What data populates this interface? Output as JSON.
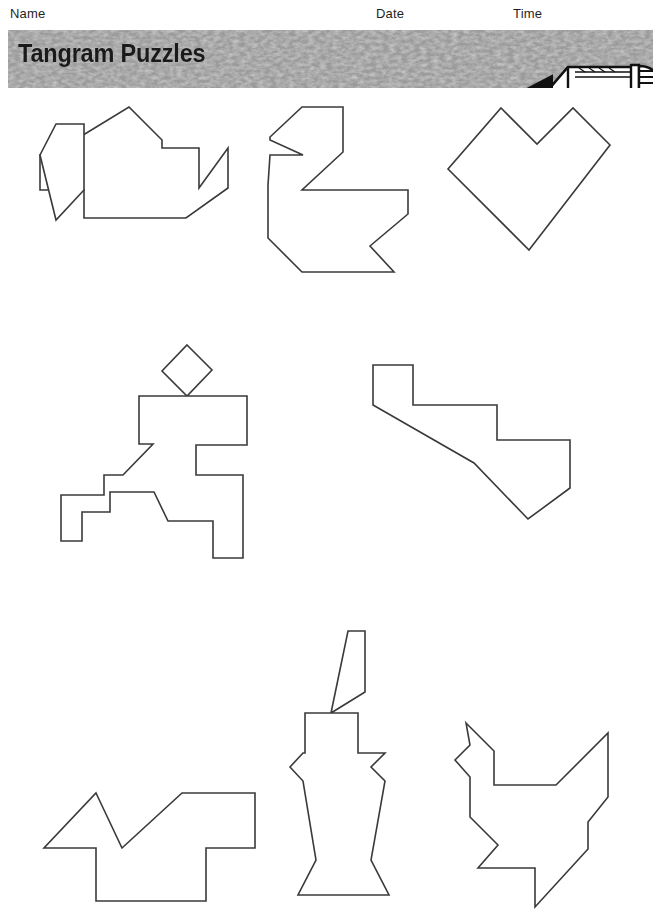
{
  "header": {
    "name_label": "Name",
    "date_label": "Date",
    "time_label": "Time"
  },
  "banner": {
    "title": "Tangram Puzzles",
    "background_color": "#a8a8a8",
    "text_color": "#1a1a1a",
    "pencil_icon": "pencil-icon"
  },
  "page": {
    "background_color": "#ffffff",
    "outline_color": "#3a3a3a",
    "fill_color": "#ffffff"
  },
  "puzzles": [
    {
      "name": "teapot",
      "row": 1,
      "column": 1,
      "parts": [
        {
          "name": "teapot-body",
          "points": "75,140 129,107 162,140 162,148 199,148 199,188 228,148 228,188 186,218 84,218 84,190 75,190"
        },
        {
          "name": "teapot-handle",
          "points": "40,155 40,190 75,190 75,155"
        },
        {
          "name": "teapot-spout",
          "points": "40,155 56,124 84,124 84,190 56,220"
        }
      ]
    },
    {
      "name": "swan",
      "row": 1,
      "column": 2,
      "parts": [
        {
          "name": "swan-outline",
          "points": "302,107 343,107 343,152 302,190 348,190 408,190 408,214 370,246 394,272 302,272 268,238 268,185 270,155 303,155 270,140 270,137"
        }
      ]
    },
    {
      "name": "heart",
      "row": 1,
      "column": 3,
      "parts": [
        {
          "name": "heart-outline",
          "points": "501,108 537,144 573,108 610,145 529,250 448,169"
        }
      ]
    },
    {
      "name": "running-person",
      "row": 2,
      "column": 1,
      "parts": [
        {
          "name": "person-head",
          "points": "187,345 212,370 187,396 162,371"
        },
        {
          "name": "person-body",
          "points": "139,396 247,396 247,445 196,445 196,475 243,475 243,558 213,558 213,521 168,521 154,492 110,492 110,512 82,512 82,541 61,541 61,495 104,495 104,475 123,475 153,444 139,444"
        }
      ]
    },
    {
      "name": "boot",
      "row": 2,
      "column": 2,
      "parts": [
        {
          "name": "boot-outline",
          "points": "373,365 413,365 413,405 497,405 497,440 570,440 570,488 528,519 474,463 373,405"
        }
      ]
    },
    {
      "name": "bird",
      "row": 3,
      "column": 1,
      "parts": [
        {
          "name": "bird-outline",
          "points": "96,793 122,848 182,793 213,793 255,793 255,848 206,848 206,901 96,901 96,848 44,848"
        }
      ]
    },
    {
      "name": "candle",
      "row": 3,
      "column": 2,
      "parts": [
        {
          "name": "candle-flame",
          "points": "331,713 348,631 365,631 365,692"
        },
        {
          "name": "candle-body",
          "points": "305,713 358,713 358,753 385,753 371,767 385,781 371,860 389,895 298,895 316,860 303,781 290,767 303,753 305,753"
        }
      ]
    },
    {
      "name": "rooster",
      "row": 3,
      "column": 3,
      "parts": [
        {
          "name": "rooster-outline",
          "points": "466,723 494,751 494,785 556,785 608,733 608,797 588,822 588,849 535,907 535,868 478,868 498,845 470,817 470,777 455,760 470,745"
        }
      ]
    }
  ]
}
